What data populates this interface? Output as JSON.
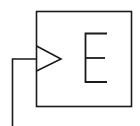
{
  "diagram": {
    "type": "logic-block",
    "block_label": "E",
    "has_clock_input": true,
    "colors": {
      "stroke": "#1a1a1a",
      "background": "#ffffff"
    }
  }
}
